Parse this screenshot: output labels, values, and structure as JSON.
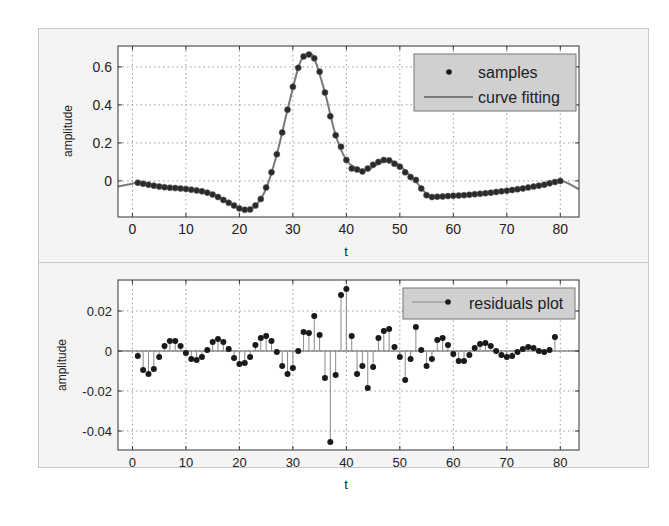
{
  "chart_data": [
    {
      "type": "line",
      "title": "",
      "xlabel": "t",
      "ylabel": "amplitude",
      "xlim": [
        -2.7,
        83.5
      ],
      "ylim": [
        -0.19,
        0.71
      ],
      "xticks": [
        0,
        10,
        20,
        30,
        40,
        50,
        60,
        70,
        80
      ],
      "xtick_labels": [
        "0",
        "10",
        "20",
        "30",
        "40",
        "50",
        "60",
        "70",
        "80"
      ],
      "yticks": [
        0,
        0.2,
        0.4,
        0.6
      ],
      "ytick_labels": [
        "0",
        "0.2",
        "0.4",
        "0.6"
      ],
      "grid": true,
      "legend_position": "upper right",
      "legend": [
        "samples",
        "curve fitting"
      ],
      "series": [
        {
          "name": "samples",
          "style": "markers",
          "x": [
            1,
            2,
            3,
            4,
            5,
            6,
            7,
            8,
            9,
            10,
            11,
            12,
            13,
            14,
            15,
            16,
            17,
            18,
            19,
            20,
            21,
            22,
            23,
            24,
            25,
            26,
            27,
            28,
            29,
            30,
            31,
            32,
            33,
            34,
            35,
            36,
            37,
            38,
            39,
            40,
            41,
            42,
            43,
            44,
            45,
            46,
            47,
            48,
            49,
            50,
            51,
            52,
            53,
            54,
            55,
            56,
            57,
            58,
            59,
            60,
            61,
            62,
            63,
            64,
            65,
            66,
            67,
            68,
            69,
            70,
            71,
            72,
            73,
            74,
            75,
            76,
            77,
            78,
            79,
            80
          ],
          "y": [
            -0.01,
            -0.015,
            -0.02,
            -0.025,
            -0.03,
            -0.033,
            -0.036,
            -0.038,
            -0.04,
            -0.043,
            -0.046,
            -0.05,
            -0.055,
            -0.062,
            -0.072,
            -0.085,
            -0.1,
            -0.115,
            -0.13,
            -0.145,
            -0.152,
            -0.15,
            -0.13,
            -0.095,
            -0.035,
            0.045,
            0.14,
            0.255,
            0.375,
            0.495,
            0.595,
            0.655,
            0.665,
            0.645,
            0.575,
            0.465,
            0.34,
            0.24,
            0.18,
            0.11,
            0.065,
            0.06,
            0.05,
            0.065,
            0.085,
            0.1,
            0.11,
            0.108,
            0.09,
            0.075,
            0.045,
            0.02,
            0.005,
            -0.04,
            -0.075,
            -0.085,
            -0.083,
            -0.082,
            -0.08,
            -0.078,
            -0.077,
            -0.075,
            -0.073,
            -0.07,
            -0.068,
            -0.065,
            -0.062,
            -0.058,
            -0.055,
            -0.052,
            -0.048,
            -0.044,
            -0.04,
            -0.035,
            -0.03,
            -0.025,
            -0.02,
            -0.013,
            -0.006,
            0.0
          ]
        },
        {
          "name": "curve fitting",
          "style": "line",
          "color": "#7a7a7a",
          "x": [
            -2.7,
            0,
            1,
            5,
            10,
            15,
            18,
            21,
            23,
            25,
            27,
            29,
            31,
            32,
            33,
            34,
            36,
            38,
            40,
            42,
            44,
            46,
            48,
            50,
            52,
            54,
            55,
            56,
            60,
            65,
            70,
            75,
            80,
            83.5
          ],
          "y": [
            -0.03,
            -0.015,
            -0.01,
            -0.03,
            -0.043,
            -0.072,
            -0.115,
            -0.152,
            -0.13,
            -0.04,
            0.14,
            0.375,
            0.595,
            0.655,
            0.668,
            0.645,
            0.465,
            0.24,
            0.11,
            0.065,
            0.058,
            0.09,
            0.11,
            0.08,
            0.025,
            -0.035,
            -0.07,
            -0.085,
            -0.078,
            -0.065,
            -0.05,
            -0.03,
            0.0,
            -0.045
          ]
        }
      ]
    },
    {
      "type": "stem",
      "title": "",
      "xlabel": "t",
      "ylabel": "amplitude",
      "xlim": [
        -2.7,
        83.5
      ],
      "ylim": [
        -0.0495,
        0.0355
      ],
      "xticks": [
        0,
        10,
        20,
        30,
        40,
        50,
        60,
        70,
        80
      ],
      "xtick_labels": [
        "0",
        "10",
        "20",
        "30",
        "40",
        "50",
        "60",
        "70",
        "80"
      ],
      "yticks": [
        -0.04,
        -0.02,
        0,
        0.02
      ],
      "ytick_labels": [
        "-0.04",
        "-0.02",
        "0",
        "0.02"
      ],
      "grid": true,
      "legend_position": "upper right",
      "legend": [
        "residuals plot"
      ],
      "series": [
        {
          "name": "residuals plot",
          "x": [
            1,
            2,
            3,
            4,
            5,
            6,
            7,
            8,
            9,
            10,
            11,
            12,
            13,
            14,
            15,
            16,
            17,
            18,
            19,
            20,
            21,
            22,
            23,
            24,
            25,
            26,
            27,
            28,
            29,
            30,
            31,
            32,
            33,
            34,
            35,
            36,
            37,
            38,
            39,
            40,
            41,
            42,
            43,
            44,
            45,
            46,
            47,
            48,
            49,
            50,
            51,
            52,
            53,
            54,
            55,
            56,
            57,
            58,
            59,
            60,
            61,
            62,
            63,
            64,
            65,
            66,
            67,
            68,
            69,
            70,
            71,
            72,
            73,
            74,
            75,
            76,
            77,
            78,
            79
          ],
          "y": [
            -0.0025,
            -0.0095,
            -0.0115,
            -0.009,
            -0.003,
            0.0025,
            0.005,
            0.005,
            0.0025,
            -0.001,
            -0.004,
            -0.0045,
            -0.003,
            0.0005,
            0.0045,
            0.006,
            0.0045,
            0.001,
            -0.0035,
            -0.0065,
            -0.006,
            -0.003,
            0.003,
            0.0065,
            0.0075,
            0.005,
            -0.0005,
            -0.0075,
            -0.0115,
            -0.0085,
            0.0,
            0.0095,
            0.009,
            0.0175,
            0.008,
            -0.0135,
            -0.0455,
            -0.012,
            0.028,
            0.031,
            0.0075,
            -0.0115,
            -0.0075,
            -0.0185,
            -0.008,
            0.0065,
            0.01,
            0.011,
            0.002,
            -0.003,
            -0.0145,
            -0.004,
            0.012,
            0.0005,
            -0.0075,
            -0.004,
            0.0055,
            0.0065,
            0.003,
            -0.0015,
            -0.005,
            -0.005,
            -0.002,
            0.0015,
            0.0035,
            0.004,
            0.0025,
            0.0,
            -0.002,
            -0.003,
            -0.0025,
            -0.0005,
            0.001,
            0.002,
            0.0015,
            0.0,
            -0.0005,
            0.0005,
            0.007
          ]
        }
      ]
    }
  ],
  "top_plot": {
    "ylabel": "amplitude",
    "xlabel": "t",
    "legend": {
      "samples_label": "samples",
      "curve_label": "curve fitting"
    }
  },
  "bottom_plot": {
    "ylabel": "amplitude",
    "xlabel": "t",
    "legend": {
      "residuals_label": "residuals plot"
    }
  }
}
